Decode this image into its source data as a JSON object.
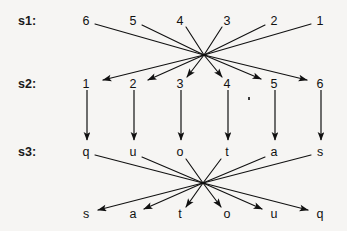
{
  "figure": {
    "background_color": "#f6f5f3",
    "ink_color": "#111111",
    "width": 347,
    "height": 231,
    "rows": [
      {
        "id": "s1",
        "label": "s1:",
        "label_x": 18,
        "label_y": 15,
        "y": 21,
        "items": [
          {
            "text": "6",
            "x": 86
          },
          {
            "text": "5",
            "x": 133
          },
          {
            "text": "4",
            "x": 180
          },
          {
            "text": "3",
            "x": 227
          },
          {
            "text": "2",
            "x": 274
          },
          {
            "text": "1",
            "x": 320
          }
        ]
      },
      {
        "id": "s2",
        "label": "s2:",
        "label_x": 18,
        "label_y": 78,
        "y": 84,
        "items": [
          {
            "text": "1",
            "x": 86
          },
          {
            "text": "2",
            "x": 133
          },
          {
            "text": "3",
            "x": 180
          },
          {
            "text": "4",
            "x": 227
          },
          {
            "text": "5",
            "x": 274
          },
          {
            "text": "6",
            "x": 320
          }
        ]
      },
      {
        "id": "s3",
        "label": "s3:",
        "label_x": 18,
        "label_y": 146,
        "y": 152,
        "items": [
          {
            "text": "q",
            "x": 86
          },
          {
            "text": "u",
            "x": 133
          },
          {
            "text": "o",
            "x": 180
          },
          {
            "text": "t",
            "x": 227
          },
          {
            "text": "a",
            "x": 274
          },
          {
            "text": "s",
            "x": 320
          }
        ]
      },
      {
        "id": "s4",
        "label": "",
        "label_x": 18,
        "label_y": 208,
        "y": 214,
        "items": [
          {
            "text": "s",
            "x": 86
          },
          {
            "text": "a",
            "x": 133
          },
          {
            "text": "t",
            "x": 180
          },
          {
            "text": "o",
            "x": 227
          },
          {
            "text": "u",
            "x": 274
          },
          {
            "text": "q",
            "x": 320
          }
        ]
      }
    ],
    "crossing_points": [
      {
        "id": "upper-crossing",
        "x": 204,
        "y": 55
      },
      {
        "id": "lower-crossing",
        "x": 203,
        "y": 183
      }
    ],
    "permutation_mapping_s1_to_s2": [
      {
        "from": "6",
        "to": "1"
      },
      {
        "from": "5",
        "to": "2"
      },
      {
        "from": "4",
        "to": "3"
      },
      {
        "from": "3",
        "to": "4"
      },
      {
        "from": "2",
        "to": "5"
      },
      {
        "from": "1",
        "to": "6"
      }
    ],
    "vertical_mapping_s2_to_s3": [
      {
        "from": "1",
        "to": "q"
      },
      {
        "from": "2",
        "to": "u"
      },
      {
        "from": "3",
        "to": "o"
      },
      {
        "from": "4",
        "to": "t"
      },
      {
        "from": "5",
        "to": "a"
      },
      {
        "from": "6",
        "to": "s"
      }
    ],
    "permutation_mapping_s3_to_s4": [
      {
        "from": "q",
        "to": "q"
      },
      {
        "from": "u",
        "to": "u"
      },
      {
        "from": "o",
        "to": "o"
      },
      {
        "from": "t",
        "to": "t"
      },
      {
        "from": "a",
        "to": "a"
      },
      {
        "from": "s",
        "to": "s"
      }
    ],
    "speck": {
      "x": 248,
      "y": 97
    }
  }
}
